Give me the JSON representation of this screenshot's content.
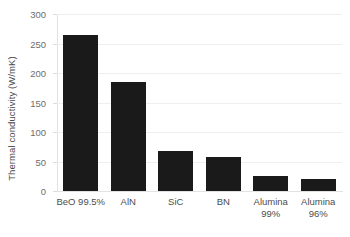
{
  "chart_data": {
    "type": "bar",
    "title": "",
    "xlabel": "",
    "ylabel": "Thermal conductivity (W/mK)",
    "categories": [
      "BeO 99.5%",
      "AlN",
      "SiC",
      "BN",
      "Alumina\n99%",
      "Alumina\n96%"
    ],
    "values": [
      265,
      185,
      68,
      58,
      26,
      20
    ],
    "ylim": [
      0,
      300
    ],
    "yticks": [
      0,
      50,
      100,
      150,
      200,
      250,
      300
    ],
    "ytick_labels": [
      "0",
      "50",
      "100",
      "150",
      "200",
      "250",
      "300"
    ],
    "grid": true,
    "legend": false,
    "bar_color": "#1a1a1a",
    "axis_color": "#e2e2e2",
    "grid_color": "#efefef",
    "label_color": "#4d4d4d"
  }
}
